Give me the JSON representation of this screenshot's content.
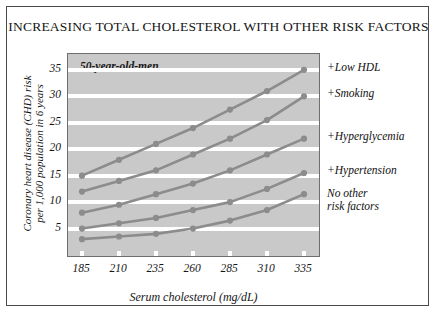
{
  "title": "INCREASING TOTAL CHOLESTEROL WITH OTHER RISK FACTORS",
  "inner_title": "50-year-old-men",
  "axis": {
    "xlabel": "Serum cholesterol (mg/dL)",
    "ylabel_line1": "Coronary heart disease (CHD) risk",
    "ylabel_line2": "per 1,000 population in 6 years"
  },
  "colors": {
    "plot_background": "#c9c9c9",
    "gridline": "#ffffff",
    "series_line": "#8c8c8c",
    "marker": "#8c8c8c",
    "frame": "#4a4a4a",
    "text": "#141414"
  },
  "chart_data": {
    "type": "line",
    "title": "INCREASING TOTAL CHOLESTEROL WITH OTHER RISK FACTORS",
    "subtitle": "50-year-old-men",
    "xlabel": "Serum cholesterol (mg/dL)",
    "ylabel": "Coronary heart disease (CHD) risk per 1,000 population in 6 years",
    "x": [
      185,
      210,
      235,
      260,
      285,
      310,
      335
    ],
    "xticks": [
      "185",
      "210",
      "235",
      "260",
      "285",
      "310",
      "335"
    ],
    "yticks": [
      5,
      10,
      15,
      20,
      25,
      30,
      35
    ],
    "ylim": [
      0,
      38
    ],
    "grid": true,
    "legend_position": "right-of-plot",
    "series": [
      {
        "name": "+Low HDL",
        "values": [
          15,
          18,
          21,
          24,
          27.5,
          31,
          35
        ]
      },
      {
        "name": "+Smoking",
        "values": [
          12,
          14,
          16,
          19,
          22,
          25.5,
          30
        ]
      },
      {
        "name": "+Hyperglycemia",
        "values": [
          8,
          9.5,
          11.5,
          13.5,
          16,
          19,
          22
        ]
      },
      {
        "name": "+Hypertension",
        "values": [
          5,
          6,
          7,
          8.5,
          10,
          12.5,
          15.5
        ]
      },
      {
        "name": "No other risk factors",
        "values": [
          3,
          3.5,
          4,
          5,
          6.5,
          8.5,
          11.5
        ]
      }
    ]
  },
  "series_labels": [
    {
      "text": "+Low HDL",
      "line2": ""
    },
    {
      "text": "+Smoking",
      "line2": ""
    },
    {
      "text": "+Hyperglycemia",
      "line2": ""
    },
    {
      "text": "+Hypertension",
      "line2": ""
    },
    {
      "text": "No other",
      "line2": "risk factors"
    }
  ]
}
